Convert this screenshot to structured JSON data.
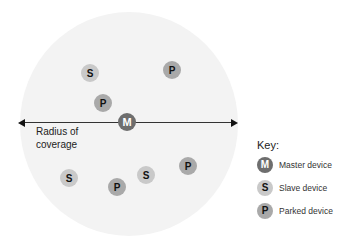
{
  "diagram": {
    "radius_label": "Radius of coverage",
    "devices": [
      {
        "type": "S",
        "label": "S",
        "x": 90,
        "y": 73
      },
      {
        "type": "P",
        "label": "P",
        "x": 172,
        "y": 70
      },
      {
        "type": "P",
        "label": "P",
        "x": 103,
        "y": 103
      },
      {
        "type": "M",
        "label": "M",
        "x": 127,
        "y": 122
      },
      {
        "type": "S",
        "label": "S",
        "x": 69,
        "y": 178
      },
      {
        "type": "P",
        "label": "P",
        "x": 117,
        "y": 187
      },
      {
        "type": "S",
        "label": "S",
        "x": 146,
        "y": 175
      },
      {
        "type": "P",
        "label": "P",
        "x": 188,
        "y": 166
      }
    ]
  },
  "key": {
    "title": "Key:",
    "items": [
      {
        "symbol": "M",
        "label": "Master device"
      },
      {
        "symbol": "S",
        "label": "Slave device"
      },
      {
        "symbol": "P",
        "label": "Parked device"
      }
    ]
  },
  "colors": {
    "master": "#6e6e6e",
    "slave": "#c9c9c9",
    "parked": "#a9a9a9",
    "coverage": "#f3f3f3"
  }
}
